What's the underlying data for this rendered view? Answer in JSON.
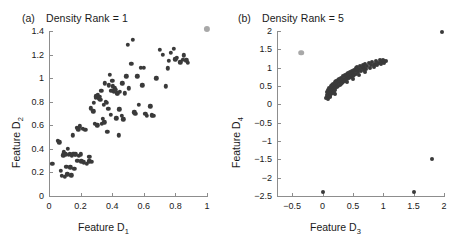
{
  "figure": {
    "background_color": "#ffffff",
    "point_color": "#3a3a3a",
    "highlight_color": "#a8a8a8",
    "axis_color": "#8d8d8d"
  },
  "panels": [
    {
      "letter": "(a)",
      "title": "Density Rank = 1",
      "xlabel_text": "Feature D",
      "xlabel_sub": "1",
      "ylabel_text": "Feature D",
      "ylabel_sub": "2"
    },
    {
      "letter": "(b)",
      "title": "Density Rank = 5",
      "xlabel_text": "Feature D",
      "xlabel_sub": "3",
      "ylabel_text": "Feature D",
      "ylabel_sub": "4"
    }
  ],
  "chart_data": [
    {
      "type": "scatter",
      "title": "Density Rank = 1",
      "panel": "(a)",
      "xlabel": "Feature D1",
      "ylabel": "Feature D2",
      "xlim": [
        0,
        1
      ],
      "ylim": [
        0,
        1.4
      ],
      "xticks": [
        0,
        0.2,
        0.4,
        0.6,
        0.8,
        1
      ],
      "xticklabels": [
        "0",
        "0.2",
        "0.4",
        "0.6",
        "0.8",
        "1"
      ],
      "yticks": [
        0,
        0.2,
        0.4,
        0.6,
        0.8,
        1,
        1.2,
        1.4
      ],
      "yticklabels": [
        "0",
        "0.2",
        "0.4",
        "0.6",
        "0.8",
        "1",
        "1.2",
        "1.4"
      ],
      "grid": false,
      "legend": "none",
      "series": [
        {
          "name": "data-points",
          "color": "#3a3a3a",
          "marker": "circle",
          "points": [
            [
              0.02,
              0.275
            ],
            [
              0.055,
              0.47
            ],
            [
              0.065,
              0.455
            ],
            [
              0.075,
              0.215
            ],
            [
              0.08,
              0.17
            ],
            [
              0.09,
              0.345
            ],
            [
              0.095,
              0.37
            ],
            [
              0.1,
              0.165
            ],
            [
              0.105,
              0.355
            ],
            [
              0.11,
              0.25
            ],
            [
              0.115,
              0.185
            ],
            [
              0.12,
              0.4
            ],
            [
              0.125,
              0.35
            ],
            [
              0.13,
              0.36
            ],
            [
              0.135,
              0.245
            ],
            [
              0.14,
              0.175
            ],
            [
              0.145,
              0.345
            ],
            [
              0.15,
              0.515
            ],
            [
              0.155,
              0.36
            ],
            [
              0.16,
              0.23
            ],
            [
              0.165,
              0.355
            ],
            [
              0.17,
              0.355
            ],
            [
              0.175,
              0.58
            ],
            [
              0.18,
              0.3
            ],
            [
              0.185,
              0.565
            ],
            [
              0.19,
              0.34
            ],
            [
              0.195,
              0.59
            ],
            [
              0.2,
              0.355
            ],
            [
              0.205,
              0.295
            ],
            [
              0.215,
              0.57
            ],
            [
              0.22,
              0.285
            ],
            [
              0.23,
              0.56
            ],
            [
              0.24,
              0.275
            ],
            [
              0.25,
              0.335
            ],
            [
              0.255,
              0.295
            ],
            [
              0.26,
              0.33
            ],
            [
              0.265,
              0.745
            ],
            [
              0.27,
              0.29
            ],
            [
              0.28,
              0.72
            ],
            [
              0.285,
              0.79
            ],
            [
              0.29,
              0.615
            ],
            [
              0.295,
              0.835
            ],
            [
              0.3,
              0.845
            ],
            [
              0.305,
              0.6
            ],
            [
              0.31,
              0.855
            ],
            [
              0.315,
              0.83
            ],
            [
              0.32,
              0.84
            ],
            [
              0.325,
              0.815
            ],
            [
              0.33,
              0.895
            ],
            [
              0.335,
              0.615
            ],
            [
              0.34,
              0.655
            ],
            [
              0.345,
              0.775
            ],
            [
              0.35,
              0.625
            ],
            [
              0.355,
              0.955
            ],
            [
              0.36,
              0.8
            ],
            [
              0.365,
              0.79
            ],
            [
              0.37,
              0.545
            ],
            [
              0.375,
              0.74
            ],
            [
              0.38,
              0.94
            ],
            [
              0.385,
              1.03
            ],
            [
              0.39,
              0.69
            ],
            [
              0.395,
              0.895
            ],
            [
              0.4,
              0.98
            ],
            [
              0.405,
              0.93
            ],
            [
              0.41,
              0.885
            ],
            [
              0.415,
              0.915
            ],
            [
              0.42,
              0.9
            ],
            [
              0.425,
              0.66
            ],
            [
              0.43,
              0.87
            ],
            [
              0.435,
              0.87
            ],
            [
              0.44,
              0.515
            ],
            [
              0.445,
              0.735
            ],
            [
              0.45,
              0.885
            ],
            [
              0.46,
              0.68
            ],
            [
              0.465,
              0.955
            ],
            [
              0.47,
              0.65
            ],
            [
              0.48,
              0.87
            ],
            [
              0.49,
              1.015
            ],
            [
              0.5,
              1.285
            ],
            [
              0.505,
              0.915
            ],
            [
              0.52,
              1.12
            ],
            [
              0.53,
              1.325
            ],
            [
              0.54,
              0.71
            ],
            [
              0.545,
              0.7
            ],
            [
              0.56,
              1.015
            ],
            [
              0.57,
              0.775
            ],
            [
              0.58,
              1.09
            ],
            [
              0.59,
              0.94
            ],
            [
              0.6,
              1.09
            ],
            [
              0.61,
              0.7
            ],
            [
              0.62,
              0.68
            ],
            [
              0.64,
              0.76
            ],
            [
              0.65,
              0.685
            ],
            [
              0.66,
              0.68
            ],
            [
              0.68,
              1.0
            ],
            [
              0.7,
              1.24
            ],
            [
              0.72,
              1.2
            ],
            [
              0.74,
              0.93
            ],
            [
              0.75,
              1.085
            ],
            [
              0.76,
              1.145
            ],
            [
              0.77,
              1.215
            ],
            [
              0.79,
              1.25
            ],
            [
              0.8,
              1.16
            ],
            [
              0.81,
              1.175
            ],
            [
              0.83,
              1.135
            ],
            [
              0.845,
              1.155
            ],
            [
              0.855,
              1.195
            ],
            [
              0.87,
              1.15
            ],
            [
              0.88,
              1.13
            ]
          ]
        },
        {
          "name": "highlighted-point",
          "color": "#a8a8a8",
          "marker": "circle",
          "points": [
            [
              1.0,
              1.42
            ]
          ]
        }
      ]
    },
    {
      "type": "scatter",
      "title": "Density Rank = 5",
      "panel": "(b)",
      "xlabel": "Feature D3",
      "ylabel": "Feature D4",
      "xlim": [
        -0.75,
        2
      ],
      "ylim": [
        -2.5,
        2
      ],
      "xticks": [
        -0.5,
        0,
        0.5,
        1,
        1.5,
        2
      ],
      "xticklabels": [
        "−0.5",
        "0",
        "0.5",
        "1",
        "1.5",
        "2"
      ],
      "yticks": [
        -2.5,
        -2,
        -1.5,
        -1,
        -0.5,
        0,
        0.5,
        1,
        1.5,
        2
      ],
      "yticklabels": [
        "−2.5",
        "−2",
        "−1.5",
        "−1",
        "−0.5",
        "0",
        "0.5",
        "1",
        "1.5",
        "2"
      ],
      "grid": false,
      "legend": "none",
      "series": [
        {
          "name": "dense-cluster",
          "color": "#3a3a3a",
          "marker": "circle",
          "points": [
            [
              0.06,
              0.18
            ],
            [
              0.07,
              0.25
            ],
            [
              0.075,
              0.33
            ],
            [
              0.08,
              0.21
            ],
            [
              0.085,
              0.4
            ],
            [
              0.09,
              0.3
            ],
            [
              0.095,
              0.15
            ],
            [
              0.1,
              0.36
            ],
            [
              0.105,
              0.45
            ],
            [
              0.11,
              0.26
            ],
            [
              0.115,
              0.34
            ],
            [
              0.12,
              0.42
            ],
            [
              0.125,
              0.19
            ],
            [
              0.13,
              0.31
            ],
            [
              0.135,
              0.5
            ],
            [
              0.14,
              0.38
            ],
            [
              0.145,
              0.28
            ],
            [
              0.15,
              0.46
            ],
            [
              0.155,
              0.35
            ],
            [
              0.16,
              0.53
            ],
            [
              0.165,
              0.4
            ],
            [
              0.17,
              0.3
            ],
            [
              0.175,
              0.48
            ],
            [
              0.18,
              0.56
            ],
            [
              0.185,
              0.42
            ],
            [
              0.19,
              0.35
            ],
            [
              0.195,
              0.51
            ],
            [
              0.2,
              0.6
            ],
            [
              0.205,
              0.45
            ],
            [
              0.21,
              0.38
            ],
            [
              0.215,
              0.54
            ],
            [
              0.22,
              0.63
            ],
            [
              0.23,
              0.47
            ],
            [
              0.24,
              0.57
            ],
            [
              0.25,
              0.66
            ],
            [
              0.255,
              0.5
            ],
            [
              0.265,
              0.6
            ],
            [
              0.275,
              0.69
            ],
            [
              0.285,
              0.54
            ],
            [
              0.295,
              0.63
            ],
            [
              0.305,
              0.72
            ],
            [
              0.315,
              0.58
            ],
            [
              0.325,
              0.67
            ],
            [
              0.335,
              0.76
            ],
            [
              0.345,
              0.62
            ],
            [
              0.355,
              0.7
            ],
            [
              0.365,
              0.79
            ],
            [
              0.375,
              0.65
            ],
            [
              0.385,
              0.74
            ],
            [
              0.395,
              0.82
            ],
            [
              0.405,
              0.68
            ],
            [
              0.415,
              0.77
            ],
            [
              0.425,
              0.86
            ],
            [
              0.435,
              0.71
            ],
            [
              0.445,
              0.8
            ],
            [
              0.455,
              0.89
            ],
            [
              0.465,
              0.74
            ],
            [
              0.475,
              0.83
            ],
            [
              0.485,
              0.92
            ],
            [
              0.495,
              0.78
            ],
            [
              0.505,
              0.86
            ],
            [
              0.515,
              0.95
            ],
            [
              0.525,
              0.81
            ],
            [
              0.535,
              0.9
            ],
            [
              0.545,
              0.98
            ],
            [
              0.555,
              0.84
            ],
            [
              0.565,
              0.93
            ],
            [
              0.575,
              1.01
            ],
            [
              0.585,
              0.87
            ],
            [
              0.6,
              0.96
            ],
            [
              0.615,
              1.04
            ],
            [
              0.63,
              0.9
            ],
            [
              0.645,
              0.99
            ],
            [
              0.66,
              1.07
            ],
            [
              0.675,
              0.93
            ],
            [
              0.69,
              1.02
            ],
            [
              0.705,
              1.1
            ],
            [
              0.72,
              0.96
            ],
            [
              0.74,
              1.05
            ],
            [
              0.76,
              1.13
            ],
            [
              0.78,
              1.0
            ],
            [
              0.8,
              1.08
            ],
            [
              0.82,
              1.16
            ],
            [
              0.84,
              1.02
            ],
            [
              0.86,
              1.1
            ],
            [
              0.88,
              1.18
            ],
            [
              0.9,
              1.06
            ],
            [
              0.92,
              1.14
            ],
            [
              0.94,
              1.2
            ],
            [
              0.96,
              1.09
            ],
            [
              0.98,
              1.16
            ],
            [
              1.0,
              1.22
            ],
            [
              1.02,
              1.12
            ],
            [
              1.04,
              1.19
            ],
            [
              0.12,
              0.23
            ],
            [
              0.2,
              0.29
            ],
            [
              0.3,
              0.56
            ],
            [
              0.4,
              0.6
            ],
            [
              0.5,
              0.7
            ],
            [
              0.6,
              0.8
            ],
            [
              0.7,
              0.88
            ],
            [
              0.85,
              1.06
            ],
            [
              0.95,
              1.13
            ],
            [
              1.01,
              1.17
            ]
          ]
        },
        {
          "name": "outliers",
          "color": "#3a3a3a",
          "marker": "circle",
          "points": [
            [
              0.0,
              -2.4
            ],
            [
              1.5,
              -2.4
            ],
            [
              1.8,
              -1.5
            ],
            [
              1.96,
              1.98
            ]
          ]
        },
        {
          "name": "highlighted-point",
          "color": "#a8a8a8",
          "marker": "circle",
          "points": [
            [
              -0.35,
              1.41
            ]
          ]
        }
      ]
    }
  ]
}
